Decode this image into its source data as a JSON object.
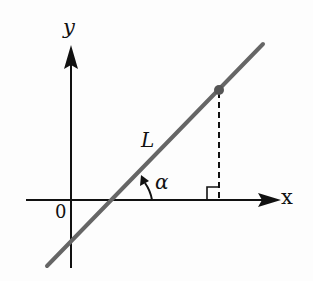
{
  "diagram": {
    "type": "coordinate-geometry",
    "labels": {
      "y_axis": "y",
      "x_axis": "x",
      "origin": "0",
      "line": "L",
      "angle": "α"
    },
    "elements": {
      "x_axis": {
        "from": [
          26,
          200
        ],
        "to": [
          281,
          200
        ],
        "arrow": "right"
      },
      "y_axis": {
        "from": [
          71,
          268
        ],
        "to": [
          71,
          45
        ],
        "arrow": "up"
      },
      "line_L": {
        "from": [
          47,
          266
        ],
        "to": [
          263,
          44
        ],
        "stroke": "gray"
      },
      "point": {
        "at": [
          219,
          90
        ]
      },
      "dashed_drop": {
        "from": [
          219,
          90
        ],
        "to": [
          219,
          200
        ]
      },
      "right_angle_mark": {
        "corner": [
          219,
          200
        ],
        "size": 13
      },
      "angle_arc": {
        "vertex": [
          111,
          200
        ],
        "label": "α"
      }
    },
    "colors": {
      "axis": "#111111",
      "line": "#666666",
      "point": "#555555",
      "background": "#fdfdfd"
    }
  }
}
